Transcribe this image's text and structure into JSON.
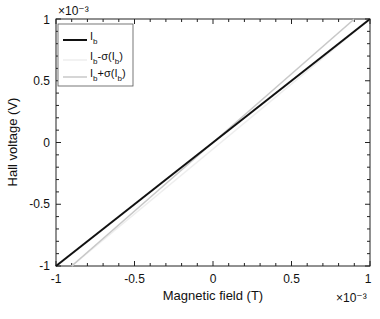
{
  "chart_data": {
    "type": "line",
    "title": "",
    "xlabel": "Magnetic field (T)",
    "ylabel": "Hall voltage (V)",
    "x_multiplier": "×10⁻³",
    "y_multiplier": "×10⁻³",
    "xlim": [
      -1,
      1
    ],
    "ylim": [
      -1,
      1
    ],
    "x_ticks": [
      "-1",
      "-0.5",
      "0",
      "0.5",
      "1"
    ],
    "y_ticks": [
      "-1",
      "-0.5",
      "0",
      "0.5",
      "1"
    ],
    "grid": false,
    "legend_position": "upper left",
    "series": [
      {
        "name": "I_b",
        "label_main": "I",
        "label_sub": "b",
        "color": "#111111",
        "x": [
          -1,
          1
        ],
        "y": [
          -1,
          1
        ]
      },
      {
        "name": "I_b-σ(I_b)",
        "label_main": "I",
        "label_sub": "b",
        "label_rest": "-σ(I",
        "label_sub2": "b",
        "label_end": ")",
        "color": "#eeeeee",
        "x": [
          -0.9,
          1
        ],
        "y": [
          -1,
          1.0
        ]
      },
      {
        "name": "I_b+σ(I_b)",
        "label_main": "I",
        "label_sub": "b",
        "label_rest": "+σ(I",
        "label_sub2": "b",
        "label_end": ")",
        "color": "#c8c8c8",
        "x": [
          -0.9,
          0.9
        ],
        "y": [
          -1,
          1
        ]
      }
    ]
  }
}
